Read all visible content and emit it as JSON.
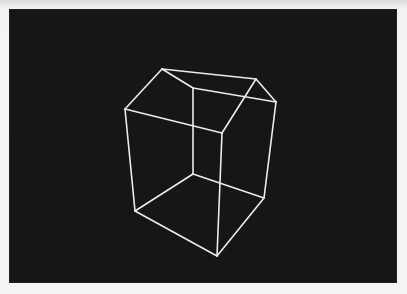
{
  "display": {
    "background_color": "#161616",
    "frame_color": "#f2f2f2",
    "line_color": "#ececec"
  },
  "wireframe": {
    "object": "house-wireframe",
    "vertices": {
      "roof_peak_left": [
        162,
        69
      ],
      "roof_peak_right": [
        256,
        79
      ],
      "eave_left": [
        125,
        109
      ],
      "eave_right": [
        276,
        102
      ],
      "eave_back": [
        193,
        88
      ],
      "eave_front": [
        222,
        133
      ],
      "base_left": [
        135,
        211
      ],
      "base_right": [
        264,
        198
      ],
      "base_back": [
        193,
        174
      ],
      "base_front": [
        217,
        256
      ]
    },
    "edges": [
      [
        "roof_peak_left",
        "roof_peak_right"
      ],
      [
        "roof_peak_left",
        "eave_left"
      ],
      [
        "roof_peak_left",
        "eave_back"
      ],
      [
        "roof_peak_right",
        "eave_right"
      ],
      [
        "roof_peak_right",
        "eave_front"
      ],
      [
        "eave_back",
        "eave_right"
      ],
      [
        "eave_left",
        "eave_front"
      ],
      [
        "eave_left",
        "base_left"
      ],
      [
        "eave_right",
        "base_right"
      ],
      [
        "eave_front",
        "base_front"
      ],
      [
        "eave_back",
        "base_back"
      ],
      [
        "base_left",
        "base_front"
      ],
      [
        "base_front",
        "base_right"
      ],
      [
        "base_left",
        "base_back"
      ],
      [
        "base_back",
        "base_right"
      ]
    ]
  }
}
